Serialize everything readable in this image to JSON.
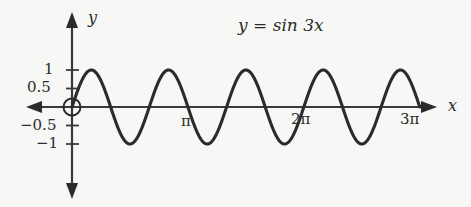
{
  "figure": {
    "background_color": "#f7f7f5",
    "curve_color": "#2b2b2b",
    "axis_color": "#3a3a3a",
    "width": 471,
    "height": 207
  },
  "labels": {
    "function_label": "y = sin 3x",
    "x_axis_name": "x",
    "y_axis_name": "y"
  },
  "chart_data": {
    "type": "line",
    "title": "y = sin 3x",
    "xlabel": "x",
    "ylabel": "y",
    "function": "y = sin(3x)",
    "amplitude": 1,
    "frequency_multiplier": 3,
    "period": "2π/3",
    "xlim": [
      -0.39,
      9.8
    ],
    "ylim": [
      -1.28,
      1.28
    ],
    "x_domain_drawn": [
      0,
      9.4248
    ],
    "grid": false,
    "legend": false,
    "x_ticks": [
      {
        "value": 3.1416,
        "label": "π"
      },
      {
        "value": 6.2832,
        "label": "2π"
      },
      {
        "value": 9.4248,
        "label": "3π"
      }
    ],
    "y_ticks": [
      {
        "value": 1,
        "label": "1"
      },
      {
        "value": 0.5,
        "label": "0.5"
      },
      {
        "value": -0.5,
        "label": "−0.5"
      },
      {
        "value": -1,
        "label": "−1"
      }
    ],
    "origin_marker": "open-circle",
    "maxima_x": [
      "π/6",
      "5π/6",
      "3π/2",
      "13π/6",
      "17π/6"
    ],
    "minima_x": [
      "π/2",
      "7π/6",
      "11π/6",
      "5π/2",
      "19π/6"
    ],
    "zero_crossings_x": [
      "0",
      "π/3",
      "2π/3",
      "π",
      "4π/3",
      "5π/3",
      "2π",
      "7π/3",
      "8π/3",
      "3π"
    ],
    "values": [
      {
        "x": 0.0,
        "y": 0.0
      },
      {
        "x": 0.5236,
        "y": 1.0
      },
      {
        "x": 1.0472,
        "y": 0.0
      },
      {
        "x": 1.5708,
        "y": -1.0
      },
      {
        "x": 2.0944,
        "y": 0.0
      },
      {
        "x": 2.618,
        "y": 1.0
      },
      {
        "x": 3.1416,
        "y": 0.0
      },
      {
        "x": 3.6652,
        "y": -1.0
      },
      {
        "x": 4.1888,
        "y": 0.0
      },
      {
        "x": 4.7124,
        "y": 1.0
      },
      {
        "x": 5.236,
        "y": 0.0
      },
      {
        "x": 5.7596,
        "y": -1.0
      },
      {
        "x": 6.2832,
        "y": 0.0
      },
      {
        "x": 6.8068,
        "y": 1.0
      },
      {
        "x": 7.3304,
        "y": 0.0
      },
      {
        "x": 7.854,
        "y": -1.0
      },
      {
        "x": 8.3776,
        "y": 0.0
      },
      {
        "x": 8.9012,
        "y": 1.0
      },
      {
        "x": 9.4248,
        "y": 0.0
      }
    ]
  }
}
